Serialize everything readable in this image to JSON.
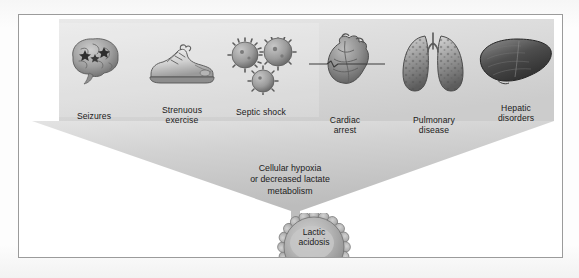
{
  "diagram": {
    "type": "funnel-diagram",
    "colors": {
      "funnel_fill": "#c9c9c9",
      "funnel_fill_light": "#dcdcdc",
      "page_background": "#ffffff",
      "frame_border": "#9b9b9b",
      "burst_fill": "#a9a9a9",
      "burst_center": "#c4c4c4",
      "text": "#1c1c1c"
    },
    "causes": [
      {
        "id": "seizures",
        "label": "Seizures",
        "icon": "brain-icon"
      },
      {
        "id": "exercise",
        "label": "Strenuous\nexercise",
        "icon": "running-shoe-icon"
      },
      {
        "id": "septic",
        "label": "Septic shock",
        "icon": "bacteria-icon"
      },
      {
        "id": "cardiac",
        "label": "Cardiac\narrest",
        "icon": "heart-flatline-icon"
      },
      {
        "id": "pulmonary",
        "label": "Pulmonary\ndisease",
        "icon": "lungs-icon"
      },
      {
        "id": "hepatic",
        "label": "Hepatic\ndisorders",
        "icon": "liver-icon"
      }
    ],
    "mechanism": "Cellular hypoxia\nor decreased lactate\nmetabolism",
    "outcome": "Lactic\nacidosis",
    "outcome_shape": "starburst-gear"
  }
}
